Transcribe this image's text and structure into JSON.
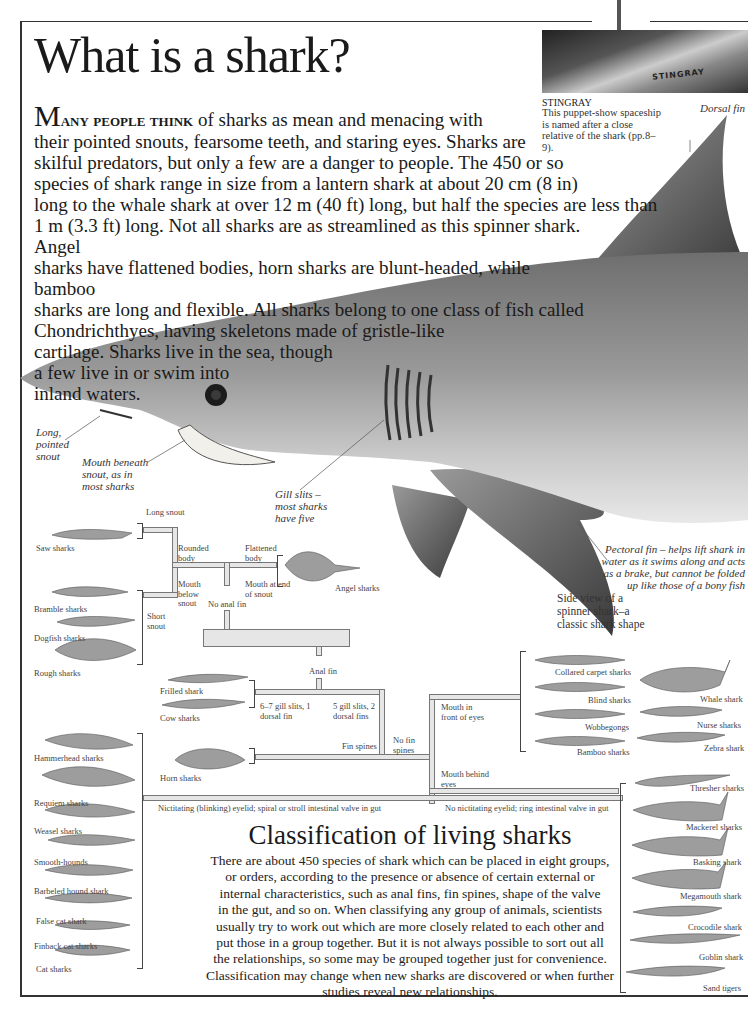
{
  "page": {
    "title": "What is a shark?",
    "intro": {
      "dropcap": "M",
      "lead_caps": "any people think",
      "lines": [
        " of sharks as mean and menacing with",
        "their pointed snouts, fearsome teeth, and staring eyes. Sharks are",
        "skilful predators, but only a few are a danger to people. The 450 or so",
        "species of shark range in size from a lantern shark at about 20 cm (8 in)",
        "long to the whale shark at over 12 m (40 ft) long, but half the species are less than",
        "1 m (3.3 ft) long. Not all sharks are as streamlined as this spinner shark. Angel",
        "sharks have flattened bodies, horn sharks are blunt-headed, while bamboo",
        "sharks are long and flexible. All sharks belong to one class of fish called",
        "Chondrichthyes, having skeletons made of gristle-like",
        "cartilage. Sharks live in the sea, though",
        "a few live in or swim into",
        "inland waters."
      ]
    },
    "stingray_caption": {
      "image_label": "STINGRAY",
      "title": "STINGRAY",
      "text": "This puppet-show spaceship is named after a close relative of the shark (pp.8–9)."
    },
    "shark_annotations": {
      "dorsal_fin": "Dorsal fin",
      "snout": "Long, pointed snout",
      "mouth": "Mouth beneath snout, as in most sharks",
      "gill_slits": "Gill slits – most sharks have five",
      "pectoral_fin": "Pectoral fin – helps lift shark in water as it swims along and acts as a brake, but cannot be folded up like those of a bony fish",
      "side_view": "Side view of a spinner shark–a classic shark shape"
    },
    "tree": {
      "features": {
        "long_snout": "Long snout",
        "short_snout": "Short snout",
        "rounded_body": "Rounded body",
        "mouth_below_snout": "Mouth below snout",
        "flattened_body": "Flattened body",
        "mouth_end_snout": "Mouth at end of snout",
        "no_anal_fin": "No anal fin",
        "anal_fin": "Anal fin",
        "gill_6_7": "6–7 gill slits, 1 dorsal fin",
        "gill_5": "5 gill slits, 2 dorsal fins",
        "fin_spines": "Fin spines",
        "no_fin_spines": "No fin spines",
        "mouth_front_eyes": "Mouth in front of eyes",
        "mouth_behind_eyes": "Mouth behind eyes",
        "nictitating": "Nictitating (blinking) eyelid; spiral or stroll intestinal valve in gut",
        "no_nictitating": "No nictitating eyelid; ring intestinal valve in gut"
      },
      "groups": {
        "saw": [
          "Saw sharks"
        ],
        "squaliform": [
          "Bramble sharks",
          "Dogfish sharks",
          "Rough sharks"
        ],
        "angel": [
          "Angel sharks"
        ],
        "hexanchiform": [
          "Frilled shark",
          "Cow sharks"
        ],
        "horn": [
          "Horn sharks"
        ],
        "carcharhiniform": [
          "Hammerhead sharks",
          "Requiem sharks",
          "Weasel sharks",
          "Smooth-hounds",
          "Barbeled hound shark",
          "False cat shark",
          "Finback cat sharks",
          "Cat sharks"
        ],
        "orectolobiform_a": [
          "Collared carpet sharks",
          "Blind sharks",
          "Wobbegongs",
          "Bamboo sharks"
        ],
        "orectolobiform_b": [
          "Whale shark",
          "Nurse sharks",
          "Zebra shark"
        ],
        "lamniform": [
          "Thresher sharks",
          "Mackerel sharks",
          "Basking shark",
          "Megamouth shark",
          "Crocodile shark",
          "Goblin shark",
          "Sand tigers"
        ]
      }
    },
    "classification": {
      "title": "Classification of living sharks",
      "text_lines": [
        "There are about 450 species of shark which can be placed in eight groups,",
        "or orders, according to the presence or absence of certain external or",
        "internal characteristics, such as anal fins, fin spines, shape of the valve",
        "in the gut, and so on. When classifying any group of animals, scientists",
        "usually try to work out which are more closely related to each other and",
        "put those in a group together. But it is not always possible to sort out all",
        "the relationships, so some may be grouped together just for convenience.",
        "Classification may change when new sharks are discovered or when further",
        "studies reveal new relationships."
      ]
    },
    "colors": {
      "connector_fill": "#e6e6e6",
      "connector_stroke": "#777777",
      "shark_body": "#8a8a8a",
      "frame": "#333333"
    }
  }
}
